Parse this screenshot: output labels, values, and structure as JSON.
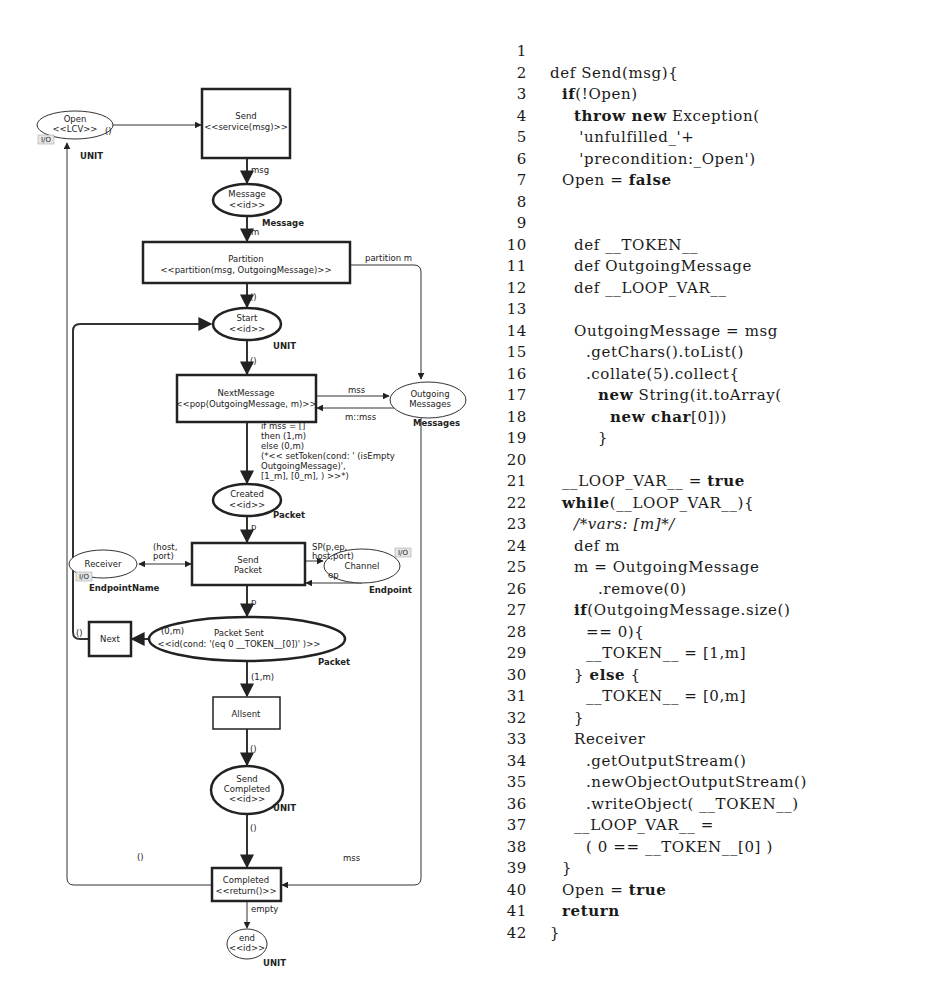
{
  "diagram": {
    "places": {
      "open": {
        "name": "Open",
        "stereo": "<<LCV>>",
        "type": "UNIT",
        "io": "I/O"
      },
      "message": {
        "name": "Message",
        "stereo": "<<id>>",
        "type": "Message"
      },
      "start": {
        "name": "Start",
        "stereo": "<<id>>",
        "type": "UNIT"
      },
      "outgoing": {
        "name1": "Outgoing",
        "name2": "Messages",
        "type": "Messages"
      },
      "created": {
        "name": "Created",
        "stereo": "<<id>>",
        "type": "Packet"
      },
      "receiver": {
        "name": "Receiver",
        "type": "EndpointName",
        "io": "I/O"
      },
      "channel": {
        "name": "Channel",
        "type": "Endpoint",
        "io": "I/O"
      },
      "packet_sent": {
        "name": "Packet Sent",
        "stereo": "<<id(cond: '(eq 0 __TOKEN__[0])' )>>",
        "type": "Packet"
      },
      "send_completed": {
        "name1": "Send",
        "name2": "Completed",
        "stereo": "<<id>>",
        "type": "UNIT"
      },
      "end": {
        "name": "end",
        "stereo": "<<id>>",
        "type": "UNIT"
      }
    },
    "transitions": {
      "send": {
        "name": "Send",
        "stereo": "<<service(msg)>>"
      },
      "partition": {
        "name": "Partition",
        "stereo": "<<partition(msg, OutgoingMessage)>>"
      },
      "next_message": {
        "name": "NextMessage",
        "stereo": "<<pop(OutgoingMessage, m)>>"
      },
      "send_packet": {
        "name1": "Send",
        "name2": "Packet"
      },
      "next": {
        "name": "Next"
      },
      "allsent": {
        "name": "Allsent"
      },
      "completed": {
        "name": "Completed",
        "stereo": "<<return()>>"
      }
    },
    "arcs": {
      "open_to_send": "()",
      "send_to_message": "msg",
      "message_to_partition": "m",
      "partition_to_start": "()",
      "partition_to_outgoing": "partition m",
      "start_to_nextmessage": "()",
      "nextmessage_to_outgoing": "mss",
      "outgoing_to_nextmessage": "m::mss",
      "nextmessage_to_created": [
        "if mss = []",
        "then (1,m)",
        "else (0,m)",
        "(*<< setToken(cond: ' (isEmpty",
        "OutgoingMessage)',",
        "[1_m], [0_m], ) >>*)"
      ],
      "created_to_sendpacket": "p",
      "receiver_sendpacket": [
        "(host,",
        "port)"
      ],
      "sendpacket_to_channel": [
        "SP(p,ep,",
        "host,port)"
      ],
      "channel_to_sendpacket": "ep",
      "sendpacket_to_packetsent": "p",
      "packetsent_to_next": "(0,m)",
      "next_to_start": "()",
      "packetsent_to_allsent": "(1,m)",
      "allsent_to_sendcompleted": "()",
      "sendcompleted_to_completed": "()",
      "completed_to_open": "()",
      "outgoing_to_completed": "mss",
      "completed_to_end": "empty"
    }
  },
  "code": {
    "lines": [
      {
        "n": "1",
        "indent": 0,
        "parts": []
      },
      {
        "n": "2",
        "indent": 0,
        "parts": [
          {
            "t": "def Send(msg){"
          }
        ]
      },
      {
        "n": "3",
        "indent": 1,
        "parts": [
          {
            "t": "if",
            "k": "kw"
          },
          {
            "t": "(!Open)"
          }
        ]
      },
      {
        "n": "4",
        "indent": 2,
        "parts": [
          {
            "t": "throw new",
            "k": "kw"
          },
          {
            "t": " Exception("
          }
        ]
      },
      {
        "n": "5",
        "indent": 2,
        "parts": [
          {
            "t": " 'unfulfilled_'+"
          }
        ]
      },
      {
        "n": "6",
        "indent": 2,
        "parts": [
          {
            "t": " 'precondition:_Open')"
          }
        ]
      },
      {
        "n": "7",
        "indent": 1,
        "parts": [
          {
            "t": "Open = "
          },
          {
            "t": "false",
            "k": "kw"
          }
        ]
      },
      {
        "n": "8",
        "indent": 0,
        "parts": []
      },
      {
        "n": "9",
        "indent": 0,
        "parts": []
      },
      {
        "n": "10",
        "indent": 2,
        "parts": [
          {
            "t": "def __TOKEN__"
          }
        ]
      },
      {
        "n": "11",
        "indent": 2,
        "parts": [
          {
            "t": "def OutgoingMessage"
          }
        ]
      },
      {
        "n": "12",
        "indent": 2,
        "parts": [
          {
            "t": "def __LOOP_VAR__"
          }
        ]
      },
      {
        "n": "13",
        "indent": 0,
        "parts": []
      },
      {
        "n": "14",
        "indent": 2,
        "parts": [
          {
            "t": "OutgoingMessage = msg"
          }
        ]
      },
      {
        "n": "15",
        "indent": 3,
        "parts": [
          {
            "t": ".getChars().toList()"
          }
        ]
      },
      {
        "n": "16",
        "indent": 3,
        "parts": [
          {
            "t": ".collate(5).collect{"
          }
        ]
      },
      {
        "n": "17",
        "indent": 4,
        "parts": [
          {
            "t": "new",
            "k": "kw"
          },
          {
            "t": " String(it.toArray("
          }
        ]
      },
      {
        "n": "18",
        "indent": 5,
        "parts": [
          {
            "t": "new char",
            "k": "kw"
          },
          {
            "t": "[0]))"
          }
        ]
      },
      {
        "n": "19",
        "indent": 4,
        "parts": [
          {
            "t": "}"
          }
        ]
      },
      {
        "n": "20",
        "indent": 0,
        "parts": []
      },
      {
        "n": "21",
        "indent": 1,
        "parts": [
          {
            "t": "__LOOP_VAR__ = "
          },
          {
            "t": "true",
            "k": "kw"
          }
        ]
      },
      {
        "n": "22",
        "indent": 1,
        "parts": [
          {
            "t": "while",
            "k": "kw"
          },
          {
            "t": "(__LOOP_VAR__){"
          }
        ]
      },
      {
        "n": "23",
        "indent": 2,
        "parts": [
          {
            "t": "/*vars: [m]*/",
            "k": "it"
          }
        ]
      },
      {
        "n": "24",
        "indent": 2,
        "parts": [
          {
            "t": "def m"
          }
        ]
      },
      {
        "n": "25",
        "indent": 2,
        "parts": [
          {
            "t": "m = OutgoingMessage"
          }
        ]
      },
      {
        "n": "26",
        "indent": 4,
        "parts": [
          {
            "t": ".remove(0)"
          }
        ]
      },
      {
        "n": "27",
        "indent": 2,
        "parts": [
          {
            "t": "if",
            "k": "kw"
          },
          {
            "t": "(OutgoingMessage.size()"
          }
        ]
      },
      {
        "n": "28",
        "indent": 3,
        "parts": [
          {
            "t": "== 0){"
          }
        ]
      },
      {
        "n": "29",
        "indent": 3,
        "parts": [
          {
            "t": "__TOKEN__ = [1,m]"
          }
        ]
      },
      {
        "n": "30",
        "indent": 2,
        "parts": [
          {
            "t": "} "
          },
          {
            "t": "else",
            "k": "kw"
          },
          {
            "t": " {"
          }
        ]
      },
      {
        "n": "31",
        "indent": 3,
        "parts": [
          {
            "t": "__TOKEN__ = [0,m]"
          }
        ]
      },
      {
        "n": "32",
        "indent": 2,
        "parts": [
          {
            "t": "}"
          }
        ]
      },
      {
        "n": "33",
        "indent": 2,
        "parts": [
          {
            "t": "Receiver"
          }
        ]
      },
      {
        "n": "34",
        "indent": 3,
        "parts": [
          {
            "t": ".getOutputStream()"
          }
        ]
      },
      {
        "n": "35",
        "indent": 3,
        "parts": [
          {
            "t": ".newObjectOutputStream()"
          }
        ]
      },
      {
        "n": "36",
        "indent": 3,
        "parts": [
          {
            "t": ".writeObject( __TOKEN__)"
          }
        ]
      },
      {
        "n": "37",
        "indent": 2,
        "parts": [
          {
            "t": "__LOOP_VAR__ ="
          }
        ]
      },
      {
        "n": "38",
        "indent": 3,
        "parts": [
          {
            "t": "( 0 == __TOKEN__[0] )"
          }
        ]
      },
      {
        "n": "39",
        "indent": 1,
        "parts": [
          {
            "t": "}"
          }
        ]
      },
      {
        "n": "40",
        "indent": 1,
        "parts": [
          {
            "t": "Open = "
          },
          {
            "t": "true",
            "k": "kw"
          }
        ]
      },
      {
        "n": "41",
        "indent": 1,
        "parts": [
          {
            "t": "return",
            "k": "kw"
          }
        ]
      },
      {
        "n": "42",
        "indent": 0,
        "parts": [
          {
            "t": "}"
          }
        ]
      }
    ]
  }
}
